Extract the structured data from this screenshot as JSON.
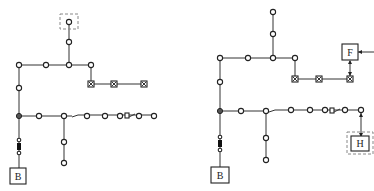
{
  "diagrams": [
    {
      "name": "left-network",
      "labels": {
        "source_box": "B"
      },
      "top_dashed_box": true,
      "right_box": null,
      "bottom_right_box": null
    },
    {
      "name": "right-network",
      "labels": {
        "source_box": "B",
        "feeder_box": "F",
        "load_box": "H"
      },
      "top_dashed_box": false
    }
  ],
  "colors": {
    "line": "#333333",
    "node_fill": "#ffffff",
    "junction_fill": "#555555",
    "dashed": "#888888"
  }
}
